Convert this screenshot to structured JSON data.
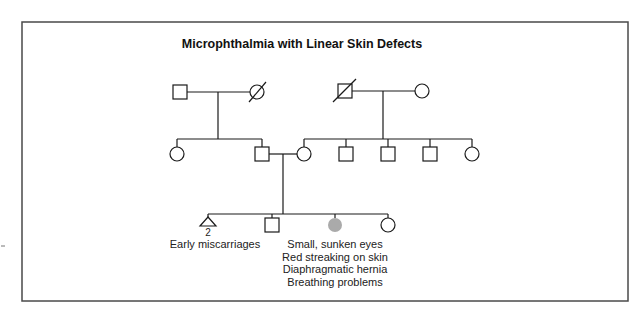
{
  "title": "Microphthalmia with Linear Skin Defects",
  "affected_color": "#aaaaaa",
  "pedigree": {
    "generation_1": [
      {
        "id": "I-1",
        "sex": "male",
        "status": "unaffected"
      },
      {
        "id": "I-2",
        "sex": "female",
        "status": "deceased"
      },
      {
        "id": "I-3",
        "sex": "male",
        "status": "deceased"
      },
      {
        "id": "I-4",
        "sex": "female",
        "status": "unaffected"
      }
    ],
    "generation_2": [
      {
        "id": "II-1",
        "sex": "female",
        "parents": "I-1 x I-2"
      },
      {
        "id": "II-2",
        "sex": "male",
        "parents": "I-1 x I-2",
        "partner": "II-3"
      },
      {
        "id": "II-3",
        "sex": "female",
        "parents": "I-3 x I-4",
        "partner": "II-2"
      },
      {
        "id": "II-4",
        "sex": "male",
        "parents": "I-3 x I-4"
      },
      {
        "id": "II-5",
        "sex": "male",
        "parents": "I-3 x I-4"
      },
      {
        "id": "II-6",
        "sex": "male",
        "parents": "I-3 x I-4"
      },
      {
        "id": "II-7",
        "sex": "female",
        "parents": "I-3 x I-4"
      }
    ],
    "generation_3": [
      {
        "id": "III-1",
        "type": "miscarriage",
        "count": "2",
        "label": "Early miscarriages"
      },
      {
        "id": "III-2",
        "sex": "male",
        "status": "unaffected"
      },
      {
        "id": "III-3",
        "sex": "female",
        "status": "affected",
        "phenotypes": [
          "Small, sunken eyes",
          "Red streaking on skin",
          "Diaphragmatic hernia",
          "Breathing problems"
        ]
      },
      {
        "id": "III-4",
        "sex": "female",
        "status": "unaffected"
      }
    ]
  }
}
